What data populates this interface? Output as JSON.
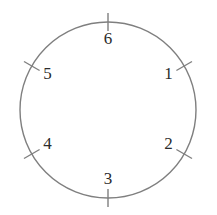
{
  "figure": {
    "kind": "circle-tick-diagram",
    "background_color": "#ffffff",
    "stroke_color": "#7f7f7f",
    "label_color": "#2b2b2b",
    "circle": {
      "center_x": 108,
      "center_y": 110,
      "radius": 88,
      "stroke_width": 1.4
    },
    "tick": {
      "inner_offset": 9,
      "outer_offset": 9,
      "stroke_width": 1.4
    },
    "label_radius": 70
  },
  "chart_data": {
    "type": "scatter",
    "title": "",
    "xlabel": "",
    "ylabel": "",
    "categories": [
      "1",
      "2",
      "3",
      "4",
      "5",
      "6"
    ],
    "angles_deg_clockwise_from_top": [
      60,
      120,
      180,
      240,
      300,
      0
    ],
    "values": [
      1,
      1,
      1,
      1,
      1,
      1
    ],
    "grid": false,
    "legend": "none"
  },
  "marks": [
    {
      "label": "6",
      "angle": 0,
      "name": "tick-6"
    },
    {
      "label": "1",
      "angle": 60,
      "name": "tick-1"
    },
    {
      "label": "2",
      "angle": 120,
      "name": "tick-2"
    },
    {
      "label": "3",
      "angle": 180,
      "name": "tick-3"
    },
    {
      "label": "4",
      "angle": 240,
      "name": "tick-4"
    },
    {
      "label": "5",
      "angle": 300,
      "name": "tick-5"
    }
  ]
}
